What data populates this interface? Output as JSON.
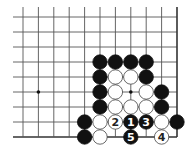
{
  "diagram": {
    "type": "go-board-fragment",
    "grid": {
      "cols": 11,
      "rows": 9,
      "x0": 23,
      "y0": 17,
      "dx": 15.4,
      "dy": 15,
      "edges": {
        "right": true,
        "bottom": true,
        "left": false,
        "top": false
      }
    },
    "hoshi": [
      {
        "col": 1,
        "row": 5
      },
      {
        "col": 7,
        "row": 5
      }
    ],
    "stones": [
      {
        "col": 5,
        "row": 3,
        "color": "black"
      },
      {
        "col": 6,
        "row": 3,
        "color": "black"
      },
      {
        "col": 7,
        "row": 3,
        "color": "black"
      },
      {
        "col": 8,
        "row": 3,
        "color": "black"
      },
      {
        "col": 5,
        "row": 4,
        "color": "black"
      },
      {
        "col": 6,
        "row": 4,
        "color": "white"
      },
      {
        "col": 7,
        "row": 4,
        "color": "white"
      },
      {
        "col": 8,
        "row": 4,
        "color": "black"
      },
      {
        "col": 5,
        "row": 5,
        "color": "black"
      },
      {
        "col": 6,
        "row": 5,
        "color": "white"
      },
      {
        "col": 8,
        "row": 5,
        "color": "white"
      },
      {
        "col": 9,
        "row": 5,
        "color": "black"
      },
      {
        "col": 5,
        "row": 6,
        "color": "black"
      },
      {
        "col": 6,
        "row": 6,
        "color": "white"
      },
      {
        "col": 7,
        "row": 6,
        "color": "white"
      },
      {
        "col": 8,
        "row": 6,
        "color": "white"
      },
      {
        "col": 9,
        "row": 6,
        "color": "black"
      },
      {
        "col": 4,
        "row": 7,
        "color": "black"
      },
      {
        "col": 5,
        "row": 7,
        "color": "white"
      },
      {
        "col": 6,
        "row": 7,
        "color": "white",
        "label": "2"
      },
      {
        "col": 7,
        "row": 7,
        "color": "black",
        "label": "1"
      },
      {
        "col": 8,
        "row": 7,
        "color": "black",
        "label": "3"
      },
      {
        "col": 9,
        "row": 7,
        "color": "white"
      },
      {
        "col": 10,
        "row": 7,
        "color": "black"
      },
      {
        "col": 4,
        "row": 8,
        "color": "black"
      },
      {
        "col": 5,
        "row": 8,
        "color": "white"
      },
      {
        "col": 7,
        "row": 8,
        "color": "black",
        "label": "5"
      },
      {
        "col": 9,
        "row": 8,
        "color": "white",
        "label": "4"
      }
    ],
    "colors": {
      "line": "#555555",
      "edge": "#333333",
      "black": "#111111",
      "white": "#ffffff",
      "stroke": "#444444"
    }
  }
}
